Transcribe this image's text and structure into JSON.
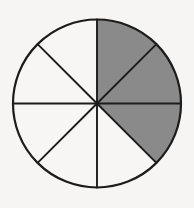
{
  "figure": {
    "name": "fraction-circle",
    "kind": "pie-fraction-diagram",
    "background_color": "#f6f5f3"
  },
  "chart_data": {
    "type": "pie",
    "title": "",
    "subtitle": "",
    "xlabel": "",
    "ylabel": "",
    "total_sectors": 8,
    "shaded_sectors": 3,
    "unshaded_sectors": 5,
    "fraction_label": "3/8",
    "fraction_numerator": 3,
    "fraction_denominator": 8,
    "fraction_value": 0.375,
    "sector_angle_degrees": 45,
    "start_angle_degrees": -90,
    "direction": "clockwise",
    "legend": [],
    "legend_position": "none",
    "grid": false,
    "categories": [
      "sector-1",
      "sector-2",
      "sector-3",
      "sector-4",
      "sector-5",
      "sector-6",
      "sector-7",
      "sector-8"
    ],
    "values": [
      45,
      45,
      45,
      45,
      45,
      45,
      45,
      45
    ],
    "series": [
      {
        "name": "sectors",
        "values": [
          {
            "id": "sector-1",
            "index": 0,
            "start_deg": -90,
            "end_deg": -45,
            "clock_span": "12:00-1:30",
            "shaded": true,
            "fill": "#8a8a8a"
          },
          {
            "id": "sector-2",
            "index": 1,
            "start_deg": -45,
            "end_deg": 0,
            "clock_span": "1:30-3:00",
            "shaded": true,
            "fill": "#8a8a8a"
          },
          {
            "id": "sector-3",
            "index": 2,
            "start_deg": 0,
            "end_deg": 45,
            "clock_span": "3:00-4:30",
            "shaded": true,
            "fill": "#8a8a8a"
          },
          {
            "id": "sector-4",
            "index": 3,
            "start_deg": 45,
            "end_deg": 90,
            "clock_span": "4:30-6:00",
            "shaded": false,
            "fill": "#f7f6f4"
          },
          {
            "id": "sector-5",
            "index": 4,
            "start_deg": 90,
            "end_deg": 135,
            "clock_span": "6:00-7:30",
            "shaded": false,
            "fill": "#f7f6f4"
          },
          {
            "id": "sector-6",
            "index": 5,
            "start_deg": 135,
            "end_deg": 180,
            "clock_span": "7:30-9:00",
            "shaded": false,
            "fill": "#f7f6f4"
          },
          {
            "id": "sector-7",
            "index": 6,
            "start_deg": 180,
            "end_deg": 225,
            "clock_span": "9:00-10:30",
            "shaded": false,
            "fill": "#f7f6f4"
          },
          {
            "id": "sector-8",
            "index": 7,
            "start_deg": 225,
            "end_deg": 270,
            "clock_span": "10:30-12:00",
            "shaded": false,
            "fill": "#f7f6f4"
          }
        ]
      }
    ]
  },
  "geometry": {
    "center_x": 97,
    "center_y": 103.5,
    "radius": 84,
    "outline_width": 2.2,
    "spoke_width": 1.9
  },
  "colors": {
    "shaded_fill": "#8a8a8a",
    "unshaded_fill": "#f7f6f4",
    "stroke": "#1c1c1c",
    "background": "#f6f5f3"
  },
  "annotations": []
}
